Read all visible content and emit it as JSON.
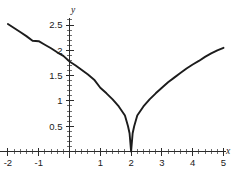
{
  "chart_data": {
    "type": "line",
    "title": "",
    "subtitle": "",
    "xlabel": "x",
    "ylabel": "y",
    "xlim": [
      -2.15,
      5.35
    ],
    "ylim": [
      0,
      2.72
    ],
    "grid": false,
    "legend": null,
    "x_ticks": [
      -2,
      -1,
      0,
      1,
      2,
      3,
      4,
      5
    ],
    "x_tick_labels": [
      "-2",
      "-1",
      "",
      "1",
      "2",
      "3",
      "4",
      "5"
    ],
    "y_ticks": [
      0.5,
      1,
      1.5,
      2,
      2.5
    ],
    "y_tick_labels": [
      "0.5",
      "1",
      "1.5",
      "2",
      "2.5"
    ],
    "x_minor_step": 0.2,
    "y_minor_step": 0.1,
    "cusp": {
      "x": 2,
      "y": 0
    },
    "series": [
      {
        "name": "y = sqrt(|x - 2|) * 1.26",
        "color": "#1c1c1c",
        "x": [
          -2.0,
          -1.8,
          -1.6,
          -1.4,
          -1.2,
          -1.0,
          -0.8,
          -0.6,
          -0.4,
          -0.2,
          0.0,
          0.2,
          0.4,
          0.6,
          0.8,
          1.0,
          1.2,
          1.4,
          1.6,
          1.8,
          1.9,
          1.95,
          2.0,
          2.05,
          2.1,
          2.2,
          2.4,
          2.6,
          2.8,
          3.0,
          3.2,
          3.4,
          3.6,
          3.8,
          4.0,
          4.2,
          4.4,
          4.6,
          4.8,
          5.0
        ],
        "y": [
          2.52,
          2.44,
          2.36,
          2.28,
          2.19,
          2.18,
          2.11,
          2.04,
          1.96,
          1.89,
          1.78,
          1.7,
          1.61,
          1.52,
          1.42,
          1.26,
          1.15,
          1.03,
          0.89,
          0.71,
          0.5,
          0.36,
          0.0,
          0.36,
          0.5,
          0.71,
          0.89,
          1.03,
          1.15,
          1.26,
          1.37,
          1.46,
          1.55,
          1.64,
          1.72,
          1.79,
          1.87,
          1.94,
          2.0,
          2.05
        ]
      }
    ]
  },
  "axes": {
    "x_axis_name": "x",
    "y_axis_name": "y"
  }
}
